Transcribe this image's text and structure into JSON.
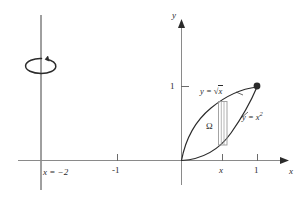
{
  "figure": {
    "title": "",
    "type": "math-diagram",
    "background_color": "#ffffff",
    "stroke_color": "#2b2b2b",
    "axes": {
      "x_axis_label": "x",
      "y_axis_label": "y",
      "x_ticks": [
        {
          "label": "-1",
          "value": -1
        },
        {
          "label": "x",
          "value": 0.64,
          "italic": true
        },
        {
          "label": "1",
          "value": 1
        }
      ],
      "y_ticks": [
        {
          "label": "1",
          "value": 1
        }
      ]
    },
    "curves": [
      {
        "name": "sqrt-curve",
        "label_prefix": "y = ",
        "label_radicand": "x",
        "label_full": "y = √x",
        "equation": "y = sqrt(x)"
      },
      {
        "name": "square-curve",
        "label_base": "y = x",
        "label_exponent": "2",
        "label_full": "y = x²",
        "equation": "y = x^2"
      }
    ],
    "region": {
      "name": "omega-region",
      "label": "Ω"
    },
    "rotation_axis": {
      "name": "axis-of-revolution",
      "label": "x = −2",
      "value": -2
    },
    "marked_point": {
      "name": "intersection-point",
      "coordinates": "(1, 1)"
    },
    "strip": {
      "name": "representative-strip",
      "label": ""
    }
  }
}
